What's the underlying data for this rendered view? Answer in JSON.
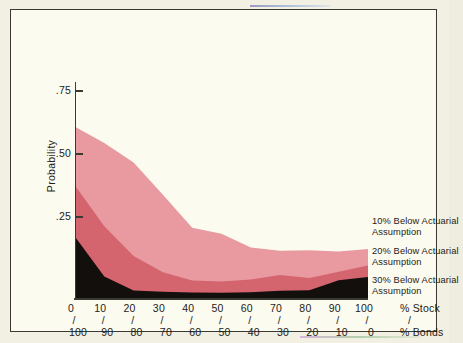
{
  "chart_data": {
    "type": "area",
    "stacked": true,
    "title": "",
    "xlabel_primary": "% Stock",
    "xlabel_secondary": "% Bonds",
    "ylabel": "Probability",
    "ylim": [
      0,
      0.875
    ],
    "xlim": [
      0,
      100
    ],
    "grid": false,
    "legend_position": "right",
    "y_ticks": [
      ".25",
      ".50",
      ".75"
    ],
    "y_tick_values": [
      0.25,
      0.5,
      0.75
    ],
    "x": [
      0,
      10,
      20,
      30,
      40,
      50,
      60,
      70,
      80,
      90,
      100
    ],
    "x_ticks_primary": [
      "0",
      "10",
      "20",
      "30",
      "40",
      "50",
      "60",
      "70",
      "80",
      "90",
      "100"
    ],
    "x_ticks_secondary": [
      "100",
      "90",
      "80",
      "70",
      "60",
      "50",
      "40",
      "30",
      "20",
      "10",
      "0"
    ],
    "x_tick_separator": "/",
    "series": [
      {
        "name": "30% Below Actuarial Assumption",
        "color": "#120f0c",
        "values": [
          0.25,
          0.088,
          0.031,
          0.026,
          0.022,
          0.021,
          0.024,
          0.03,
          0.032,
          0.073,
          0.086
        ]
      },
      {
        "name": "20% Below Actuarial Assumption",
        "color": "#d4646e",
        "values": [
          0.21,
          0.205,
          0.141,
          0.079,
          0.05,
          0.046,
          0.052,
          0.064,
          0.05,
          0.034,
          0.047
        ]
      },
      {
        "name": "10% Below Actuarial Assumption",
        "color": "#e89aa0",
        "values": [
          0.24,
          0.341,
          0.382,
          0.317,
          0.215,
          0.196,
          0.13,
          0.099,
          0.113,
          0.083,
          0.067
        ]
      }
    ],
    "cumulative_tops": {
      "30_below": [
        0.25,
        0.088,
        0.031,
        0.026,
        0.022,
        0.021,
        0.024,
        0.03,
        0.032,
        0.073,
        0.086
      ],
      "20_below": [
        0.46,
        0.293,
        0.172,
        0.105,
        0.072,
        0.067,
        0.076,
        0.094,
        0.082,
        0.107,
        0.133
      ],
      "10_below": [
        0.7,
        0.634,
        0.554,
        0.422,
        0.287,
        0.263,
        0.206,
        0.193,
        0.195,
        0.19,
        0.2
      ]
    }
  },
  "legend": {
    "entries": [
      {
        "line1": "10% Below Actuarial",
        "line2": "Assumption"
      },
      {
        "line1": "20% Below Actuarial",
        "line2": "Assumption"
      },
      {
        "line1": "30% Below Actuarial",
        "line2": "Assumption"
      }
    ]
  },
  "axes": {
    "y_title": "Probability",
    "y_labels": [
      ".75",
      ".50",
      ".25"
    ],
    "x_name_top": "% Stock",
    "x_name_bottom": "% Bonds",
    "slash": "/",
    "x_pairs": [
      {
        "stock": "0",
        "bonds": "100"
      },
      {
        "stock": "10",
        "bonds": "90"
      },
      {
        "stock": "20",
        "bonds": "80"
      },
      {
        "stock": "30",
        "bonds": "70"
      },
      {
        "stock": "40",
        "bonds": "60"
      },
      {
        "stock": "50",
        "bonds": "50"
      },
      {
        "stock": "60",
        "bonds": "40"
      },
      {
        "stock": "70",
        "bonds": "30"
      },
      {
        "stock": "80",
        "bonds": "20"
      },
      {
        "stock": "90",
        "bonds": "10"
      },
      {
        "stock": "100",
        "bonds": "0"
      }
    ]
  },
  "colors": {
    "band_light": "#e89aa0",
    "band_mid": "#d4646e",
    "band_dark": "#120f0c",
    "background": "#fcfbf0",
    "frame": "#3a3a33",
    "page": "#f2efe3",
    "text": "#1c1c18"
  }
}
